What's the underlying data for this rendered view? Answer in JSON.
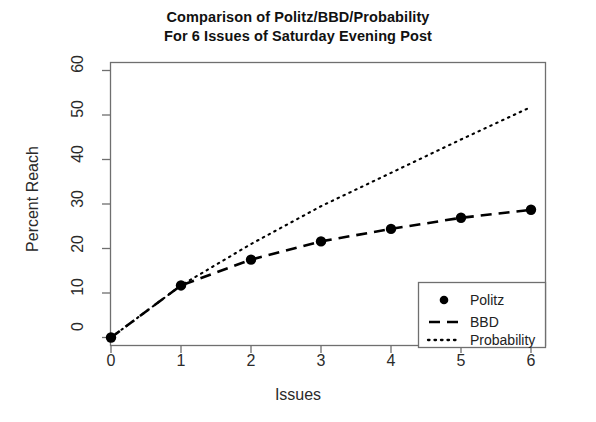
{
  "chart_data": {
    "type": "line",
    "title": "Comparison of Politz/BBD/Probability",
    "subtitle": "For 6 Issues of Saturday Evening Post",
    "xlabel": "Issues",
    "ylabel": "Percent Reach",
    "x": [
      0,
      1,
      2,
      3,
      4,
      5,
      6
    ],
    "xlim": [
      0,
      6
    ],
    "ylim": [
      0,
      60
    ],
    "xticks": [
      "0",
      "1",
      "2",
      "3",
      "4",
      "5",
      "6"
    ],
    "yticks": [
      "0",
      "10",
      "20",
      "30",
      "40",
      "50",
      "60"
    ],
    "grid": false,
    "legend_position": "bottom-right",
    "series": [
      {
        "name": "Politz",
        "style": "points",
        "marker": "filled-circle",
        "color": "#000000",
        "values": [
          0,
          11.7,
          17.5,
          21.6,
          24.4,
          26.9,
          28.7
        ]
      },
      {
        "name": "BBD",
        "style": "dashed-line",
        "color": "#000000",
        "values": [
          0,
          11.7,
          17.5,
          21.6,
          24.4,
          26.9,
          28.7
        ]
      },
      {
        "name": "Probability",
        "style": "dotted-line",
        "color": "#000000",
        "values": [
          0,
          11.7,
          21.0,
          29.5,
          37.0,
          44.5,
          51.8
        ]
      }
    ]
  },
  "title": {
    "line1": "Comparison of Politz/BBD/Probability",
    "line2": "For 6 Issues of Saturday Evening Post"
  },
  "axes": {
    "x_label": "Issues",
    "y_label": "Percent Reach",
    "x_ticks": [
      "0",
      "1",
      "2",
      "3",
      "4",
      "5",
      "6"
    ],
    "y_ticks": [
      "0",
      "10",
      "20",
      "30",
      "40",
      "50",
      "60"
    ]
  },
  "legend": {
    "entries": [
      {
        "label": "Politz",
        "marker": "filled-circle"
      },
      {
        "label": "BBD",
        "marker": "dashed-line"
      },
      {
        "label": "Probability",
        "marker": "dotted-line"
      }
    ]
  },
  "colors": {
    "ink": "#000000",
    "axis": "#6f6f6f",
    "background": "#ffffff"
  }
}
